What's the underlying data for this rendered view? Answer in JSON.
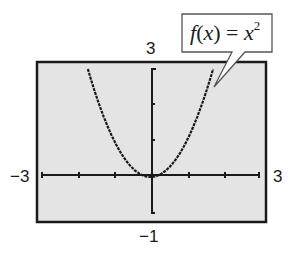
{
  "chart_data": {
    "type": "line",
    "title": "",
    "function_label": "f(x) = x^2",
    "xlabel": "",
    "ylabel": "",
    "xlim": [
      -3,
      3
    ],
    "ylim": [
      -1,
      3
    ],
    "x_ticks": [
      -3,
      -2,
      -1,
      0,
      1,
      2,
      3
    ],
    "y_ticks": [
      -1,
      0,
      1,
      2,
      3
    ],
    "grid": false,
    "series": [
      {
        "name": "f(x) = x^2",
        "x": [
          -1.73,
          -1.5,
          -1.25,
          -1.0,
          -0.75,
          -0.5,
          -0.25,
          0,
          0.25,
          0.5,
          0.75,
          1.0,
          1.25,
          1.5,
          1.73
        ],
        "y": [
          3.0,
          2.25,
          1.5625,
          1.0,
          0.5625,
          0.25,
          0.0625,
          0,
          0.0625,
          0.25,
          0.5625,
          1.0,
          1.5625,
          2.25,
          3.0
        ]
      }
    ]
  },
  "labels": {
    "ymax": "3",
    "ymin": "−1",
    "xmin": "−3",
    "xmax": "3"
  },
  "callout": {
    "f": "f",
    "open": "(",
    "x": "x",
    "close": ")",
    "eq": " = ",
    "x2": "x",
    "exp": "2"
  },
  "colors": {
    "screen_bg": "#e4e4e4",
    "ink": "#1a1a1a"
  }
}
